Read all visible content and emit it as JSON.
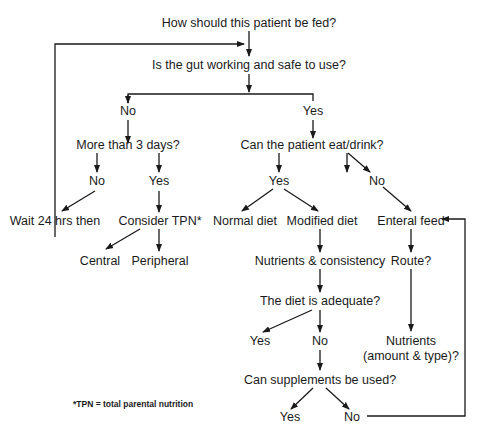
{
  "nodes": {
    "start": "How should this patient be fed?",
    "gut": "Is the gut working and safe to use?",
    "gut_no": "No",
    "gut_yes": "Yes",
    "more3": "More than 3 days?",
    "more3_no": "No",
    "more3_yes": "Yes",
    "wait": "Wait 24 hrs then",
    "tpn": "Consider TPN*",
    "central": "Central",
    "peripheral": "Peripheral",
    "eat": "Can the patient eat/drink?",
    "eat_yes": "Yes",
    "eat_no": "No",
    "normal": "Normal diet",
    "modified": "Modified diet",
    "enteral": "Enteral feed",
    "nutrients_cons": "Nutrients & consistency",
    "route": "Route?",
    "adequate": "The diet is adequate?",
    "adequate_yes": "Yes",
    "adequate_no": "No",
    "nutrients_amt_1": "Nutrients",
    "nutrients_amt_2": "(amount & type)?",
    "supplements": "Can supplements be used?",
    "supp_yes": "Yes",
    "supp_no": "No"
  },
  "footnote": "*TPN = total parental nutrition"
}
